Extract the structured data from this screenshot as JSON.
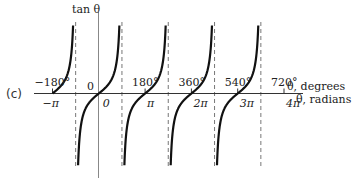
{
  "panel_label": "(c)",
  "chart_data": {
    "type": "line",
    "title": "",
    "function": "tan θ",
    "ylabel": "tan θ",
    "xlabel_degrees": "θ, degrees",
    "xlabel_radians": "θ, radians",
    "origin_label": "0",
    "degree_ticks": [
      "−180°",
      "180°",
      "360°",
      "540°",
      "720°"
    ],
    "degree_tick_values": [
      -180,
      180,
      360,
      540,
      720
    ],
    "radian_ticks": [
      "−π",
      "0",
      "π",
      "2π",
      "3π",
      "4π"
    ],
    "radian_tick_values": [
      -3.14159,
      0,
      3.14159,
      6.28319,
      9.42478,
      12.56637
    ],
    "asymptotes_degrees": [
      -90,
      90,
      270,
      450,
      630
    ],
    "branches": [
      {
        "from_deg": -180,
        "to_deg": -90,
        "partial": true
      },
      {
        "from_deg": -90,
        "to_deg": 90
      },
      {
        "from_deg": 90,
        "to_deg": 270
      },
      {
        "from_deg": 270,
        "to_deg": 450
      },
      {
        "from_deg": 450,
        "to_deg": 630
      }
    ],
    "xlim_degrees": [
      -180,
      720
    ],
    "grid": false,
    "legend": null
  }
}
